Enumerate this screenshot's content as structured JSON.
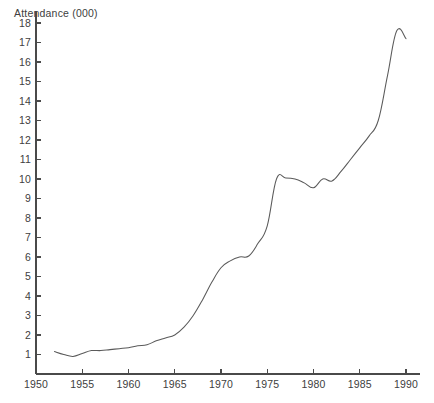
{
  "chart_data": {
    "type": "line",
    "title": "",
    "ylabel": "Attendance (000)",
    "xlabel": "",
    "xlim": [
      1950,
      1991.5
    ],
    "ylim": [
      0,
      18.6
    ],
    "grid": false,
    "legend": "none",
    "yticks": [
      1,
      2,
      3,
      4,
      5,
      6,
      7,
      8,
      9,
      10,
      11,
      12,
      13,
      14,
      15,
      16,
      17,
      18
    ],
    "ytick_labels": [
      "1",
      "2",
      "3",
      "4",
      "5",
      "6",
      "7",
      "8",
      "9",
      "10",
      "11",
      "12",
      "13",
      "14",
      "15",
      "16",
      "17",
      "18"
    ],
    "xticks": [
      1950,
      1955,
      1960,
      1965,
      1970,
      1975,
      1980,
      1985,
      1990
    ],
    "xtick_labels": [
      "1950",
      "1955",
      "1960",
      "1965",
      "1970",
      "1975",
      "1980",
      "1985",
      "1990"
    ],
    "series": [
      {
        "name": "Attendance",
        "color": "#5a5a5a",
        "x": [
          1952,
          1953,
          1954,
          1955,
          1956,
          1957,
          1958,
          1959,
          1960,
          1961,
          1962,
          1963,
          1964,
          1965,
          1966,
          1967,
          1968,
          1969,
          1970,
          1971,
          1972,
          1973,
          1974,
          1975,
          1976,
          1977,
          1978,
          1979,
          1980,
          1981,
          1982,
          1983,
          1984,
          1985,
          1986,
          1987,
          1988,
          1989,
          1990
        ],
        "values": [
          1.15,
          1.0,
          0.9,
          1.05,
          1.2,
          1.2,
          1.25,
          1.3,
          1.35,
          1.45,
          1.5,
          1.7,
          1.85,
          2.0,
          2.4,
          3.0,
          3.8,
          4.7,
          5.45,
          5.8,
          6.0,
          6.05,
          6.7,
          7.6,
          10.0,
          10.05,
          10.0,
          9.8,
          9.55,
          10.0,
          9.9,
          10.4,
          11.0,
          11.6,
          12.2,
          13.0,
          15.3,
          17.6,
          17.2
        ]
      }
    ],
    "annotations": []
  },
  "axis_geometry": {
    "note": "pixel mapping used by the template renderer",
    "x_origin_px": 36,
    "y_origin_px": 374,
    "px_per_year": 9.25,
    "px_per_unit": 19.5,
    "tick_length_px": 5
  }
}
